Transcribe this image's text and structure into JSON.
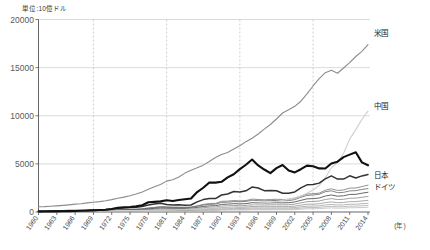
{
  "chart_data": {
    "type": "line",
    "title": "",
    "unit_note": "単位:10億ドル",
    "xlabel": "(年)",
    "ylabel": "",
    "ylim": [
      0,
      20000
    ],
    "xlim": [
      1960,
      2014
    ],
    "grid": "horizontal-solid-and-vertical-dashed",
    "legend_position": "right-inline",
    "ytick_labels": [
      "0",
      "5000",
      "10000",
      "15000",
      "20000"
    ],
    "ytick_values": [
      0,
      5000,
      10000,
      15000,
      20000
    ],
    "xtick_labels": [
      "1960",
      "1963",
      "1966",
      "1969",
      "1972",
      "1975",
      "1978",
      "1981",
      "1984",
      "1987",
      "1990",
      "1993",
      "1996",
      "1999",
      "2002",
      "2005",
      "2008",
      "2011",
      "2014"
    ],
    "xtick_values": [
      1960,
      1963,
      1966,
      1969,
      1972,
      1975,
      1978,
      1981,
      1984,
      1987,
      1990,
      1993,
      1996,
      1999,
      2002,
      2005,
      2008,
      2011,
      2014
    ],
    "vertical_gridline_years": [
      1969,
      1981,
      1993,
      2005
    ],
    "x": [
      1960,
      1961,
      1962,
      1963,
      1964,
      1965,
      1966,
      1967,
      1968,
      1969,
      1970,
      1971,
      1972,
      1973,
      1974,
      1975,
      1976,
      1977,
      1978,
      1979,
      1980,
      1981,
      1982,
      1983,
      1984,
      1985,
      1986,
      1987,
      1988,
      1989,
      1990,
      1991,
      1992,
      1993,
      1994,
      1995,
      1996,
      1997,
      1998,
      1999,
      2000,
      2001,
      2002,
      2003,
      2004,
      2005,
      2006,
      2007,
      2008,
      2009,
      2010,
      2011,
      2012,
      2013,
      2014
    ],
    "series": [
      {
        "name": "米国",
        "label": "米国",
        "color": "#8c8c8c",
        "width": 1.1,
        "values": [
          543,
          563,
          605,
          638,
          685,
          743,
          815,
          861,
          943,
          1020,
          1076,
          1168,
          1282,
          1429,
          1545,
          1685,
          1873,
          2082,
          2352,
          2627,
          2857,
          3207,
          3344,
          3638,
          4041,
          4347,
          4590,
          4870,
          5253,
          5658,
          5980,
          6174,
          6539,
          6879,
          7309,
          7664,
          8100,
          8609,
          9089,
          9661,
          10285,
          10622,
          10978,
          11511,
          12275,
          13094,
          13856,
          14478,
          14719,
          14419,
          14964,
          15518,
          16155,
          16692,
          17393
        ],
        "end_label_y": 17393
      },
      {
        "name": "中国",
        "label": "中国",
        "color": "#cfcfcf",
        "width": 1.1,
        "values": [
          60,
          50,
          47,
          50,
          59,
          70,
          76,
          73,
          70,
          79,
          92,
          99,
          113,
          138,
          144,
          163,
          153,
          174,
          149,
          178,
          191,
          195,
          205,
          230,
          259,
          309,
          300,
          327,
          410,
          459,
          398,
          413,
          492,
          618,
          564,
          734,
          863,
          961,
          1029,
          1094,
          1211,
          1339,
          1471,
          1660,
          1955,
          2286,
          2752,
          3552,
          4598,
          5110,
          6101,
          7573,
          8561,
          9607,
          10482
        ],
        "end_label_y": 10482
      },
      {
        "name": "日本",
        "label": "日本",
        "color": "#111111",
        "width": 2.1,
        "values": [
          44,
          54,
          61,
          70,
          82,
          91,
          106,
          124,
          147,
          173,
          213,
          240,
          318,
          432,
          479,
          521,
          585,
          701,
          1014,
          1054,
          1105,
          1218,
          1135,
          1243,
          1318,
          1399,
          2075,
          2520,
          3072,
          3055,
          3140,
          3593,
          3926,
          4454,
          4907,
          5449,
          4834,
          4415,
          4033,
          4563,
          4888,
          4304,
          4115,
          4446,
          4815,
          4755,
          4530,
          4515,
          5038,
          5231,
          5700,
          5960,
          6203,
          5156,
          4850
        ],
        "end_label_y": 4850
      },
      {
        "name": "ドイツ",
        "label": "ドイツ",
        "color": "#333333",
        "width": 1.5,
        "values": [
          95,
          102,
          112,
          121,
          132,
          147,
          159,
          162,
          174,
          199,
          216,
          251,
          309,
          389,
          430,
          475,
          495,
          559,
          719,
          830,
          920,
          790,
          739,
          741,
          700,
          730,
          1055,
          1290,
          1400,
          1400,
          1765,
          1870,
          2130,
          2070,
          2200,
          2590,
          2500,
          2220,
          2240,
          2200,
          1950,
          1950,
          2080,
          2510,
          2820,
          2860,
          3000,
          3440,
          3750,
          3420,
          3420,
          3760,
          3540,
          3750,
          3890
        ],
        "end_label_y": 3890
      },
      {
        "name": "other-1",
        "label": "",
        "color": "#6f6f6f",
        "width": 0.85,
        "values": [
          62,
          66,
          71,
          78,
          86,
          92,
          98,
          104,
          110,
          125,
          140,
          158,
          190,
          230,
          250,
          260,
          275,
          310,
          390,
          450,
          520,
          490,
          470,
          470,
          460,
          480,
          600,
          720,
          790,
          810,
          1000,
          1020,
          1080,
          1060,
          1100,
          1220,
          1180,
          1150,
          1180,
          1200,
          1160,
          1180,
          1290,
          1520,
          1720,
          1770,
          1840,
          2110,
          2200,
          2010,
          2040,
          2190,
          2220,
          2340,
          2430
        ]
      },
      {
        "name": "other-2",
        "label": "",
        "color": "#7e7e7e",
        "width": 0.85,
        "values": [
          73,
          78,
          82,
          88,
          95,
          102,
          112,
          120,
          128,
          140,
          152,
          170,
          200,
          250,
          270,
          290,
          305,
          345,
          420,
          490,
          560,
          540,
          510,
          505,
          500,
          520,
          640,
          790,
          880,
          900,
          1110,
          1130,
          1190,
          1150,
          1190,
          1340,
          1300,
          1270,
          1300,
          1320,
          1300,
          1320,
          1440,
          1660,
          1860,
          1900,
          1960,
          2260,
          2410,
          2240,
          2290,
          2480,
          2490,
          2640,
          2790
        ]
      },
      {
        "name": "other-3",
        "label": "",
        "color": "#8f8f8f",
        "width": 0.85,
        "values": [
          40,
          43,
          46,
          50,
          55,
          60,
          66,
          70,
          76,
          84,
          92,
          104,
          126,
          154,
          165,
          175,
          185,
          208,
          255,
          295,
          335,
          320,
          305,
          300,
          296,
          306,
          376,
          450,
          495,
          510,
          620,
          640,
          680,
          660,
          680,
          760,
          740,
          725,
          740,
          750,
          740,
          755,
          820,
          950,
          1070,
          1090,
          1140,
          1300,
          1390,
          1290,
          1320,
          1430,
          1440,
          1530,
          1610
        ]
      },
      {
        "name": "other-4",
        "label": "",
        "color": "#9b9b9b",
        "width": 0.85,
        "values": [
          30,
          32,
          34,
          37,
          41,
          45,
          49,
          53,
          57,
          63,
          69,
          78,
          94,
          116,
          124,
          131,
          139,
          156,
          191,
          221,
          251,
          240,
          229,
          225,
          222,
          230,
          282,
          338,
          372,
          383,
          465,
          480,
          510,
          495,
          510,
          570,
          555,
          544,
          555,
          563,
          555,
          566,
          615,
          713,
          803,
          818,
          855,
          975,
          1043,
          968,
          990,
          1073,
          1080,
          1148,
          1208
        ]
      },
      {
        "name": "other-5",
        "label": "",
        "color": "#a8a8a8",
        "width": 0.85,
        "values": [
          22,
          24,
          26,
          28,
          31,
          34,
          37,
          40,
          43,
          47,
          52,
          59,
          71,
          87,
          93,
          98,
          104,
          117,
          143,
          166,
          188,
          180,
          172,
          169,
          167,
          173,
          212,
          254,
          279,
          287,
          349,
          360,
          383,
          371,
          383,
          428,
          416,
          408,
          416,
          422,
          416,
          425,
          461,
          535,
          602,
          614,
          641,
          731,
          782,
          726,
          743,
          805,
          810,
          861,
          906
        ]
      },
      {
        "name": "other-6",
        "label": "",
        "color": "#b4b4b4",
        "width": 0.85,
        "values": [
          17,
          18,
          19,
          21,
          23,
          26,
          28,
          30,
          32,
          36,
          39,
          44,
          54,
          66,
          70,
          74,
          78,
          88,
          108,
          125,
          142,
          136,
          129,
          127,
          126,
          130,
          160,
          191,
          210,
          216,
          263,
          271,
          288,
          279,
          288,
          322,
          313,
          307,
          313,
          318,
          313,
          320,
          347,
          402,
          453,
          462,
          482,
          550,
          588,
          546,
          559,
          606,
          609,
          648,
          682
        ]
      },
      {
        "name": "other-7",
        "label": "",
        "color": "#bfbfbf",
        "width": 0.85,
        "values": [
          12,
          13,
          14,
          15,
          17,
          19,
          20,
          22,
          24,
          26,
          28,
          32,
          39,
          48,
          51,
          54,
          57,
          64,
          78,
          90,
          103,
          98,
          94,
          92,
          91,
          94,
          116,
          139,
          152,
          157,
          191,
          197,
          209,
          203,
          209,
          234,
          227,
          223,
          227,
          231,
          227,
          232,
          252,
          292,
          329,
          335,
          350,
          399,
          427,
          396,
          406,
          440,
          442,
          470,
          495
        ]
      },
      {
        "name": "other-8",
        "label": "",
        "color": "#555555",
        "width": 0.9,
        "values": [
          52,
          55,
          59,
          64,
          70,
          77,
          84,
          90,
          96,
          107,
          118,
          133,
          160,
          196,
          212,
          222,
          235,
          264,
          324,
          375,
          428,
          409,
          390,
          384,
          379,
          392,
          481,
          577,
          634,
          652,
          792,
          817,
          868,
          842,
          868,
          971,
          944,
          925,
          944,
          958,
          944,
          963,
          1046,
          1212,
          1365,
          1391,
          1452,
          1656,
          1772,
          1645,
          1684,
          1825,
          1836,
          1952,
          2053
        ]
      }
    ]
  },
  "axis": {
    "unit_note": "単位:10億ドル",
    "x_axis_suffix": "(年)"
  }
}
